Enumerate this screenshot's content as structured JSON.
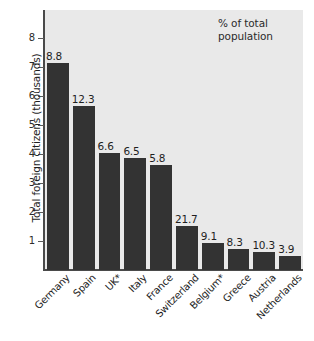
{
  "chart_data": {
    "type": "bar",
    "title": "",
    "subtitle": "",
    "xlabel": "",
    "ylabel": "Total foreign citizens (thousands)",
    "annotation": "% of total\npopulation",
    "annotation_line1": "% of total",
    "annotation_line2": "population",
    "categories": [
      "Germany",
      "Spain",
      "UK*",
      "Italy",
      "France",
      "Switzerland",
      "Belgium*",
      "Greece",
      "Austria",
      "Netherlands"
    ],
    "values": [
      7.15,
      5.65,
      4.05,
      3.85,
      3.62,
      1.52,
      0.93,
      0.74,
      0.62,
      0.48
    ],
    "data_labels": [
      "8.8",
      "12.3",
      "6.6",
      "6.5",
      "5.8",
      "21.7",
      "9.1",
      "8.3",
      "10.3",
      "3.9"
    ],
    "data_label_meaning": "% of total population",
    "yticks": [
      1,
      2,
      3,
      4,
      5,
      6,
      7,
      8
    ],
    "yticklabels": [
      "1",
      "2",
      "3",
      "4",
      "5",
      "6",
      "7",
      "8"
    ],
    "ylim": [
      0,
      9
    ],
    "grid": false,
    "legend": false,
    "bar_color": "#333333",
    "plot_background": "#e9e9e9",
    "page_background": "#ffffff",
    "text_color": "#1f1f1f"
  }
}
